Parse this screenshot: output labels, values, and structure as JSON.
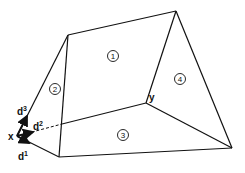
{
  "diagram": {
    "type": "polyhedron-faces",
    "points": {
      "x": {
        "label": "x",
        "pos": [
          17,
          136
        ]
      },
      "y": {
        "label": "y",
        "pos": [
          146,
          103
        ]
      }
    },
    "vertices": {
      "x": [
        17,
        136
      ],
      "top_left": [
        68,
        35
      ],
      "top_right": [
        176,
        11
      ],
      "y": [
        146,
        103
      ],
      "bottom_left": [
        59,
        157
      ],
      "bottom_right": [
        232,
        148
      ]
    },
    "faces": [
      {
        "id": "1",
        "label": "1",
        "pos": [
          113,
          56
        ]
      },
      {
        "id": "2",
        "label": "2",
        "pos": [
          55,
          89
        ]
      },
      {
        "id": "3",
        "label": "3",
        "pos": [
          123,
          135
        ]
      },
      {
        "id": "4",
        "label": "4",
        "pos": [
          180,
          79
        ]
      }
    ],
    "vectors": [
      {
        "name": "d1",
        "base": "d",
        "sup": "1",
        "label_pos": [
          20,
          157
        ]
      },
      {
        "name": "d2",
        "base": "d",
        "sup": "2",
        "label_pos": [
          34,
          130
        ]
      },
      {
        "name": "d3",
        "base": "d",
        "sup": "3",
        "label_pos": [
          18,
          112
        ]
      }
    ]
  }
}
